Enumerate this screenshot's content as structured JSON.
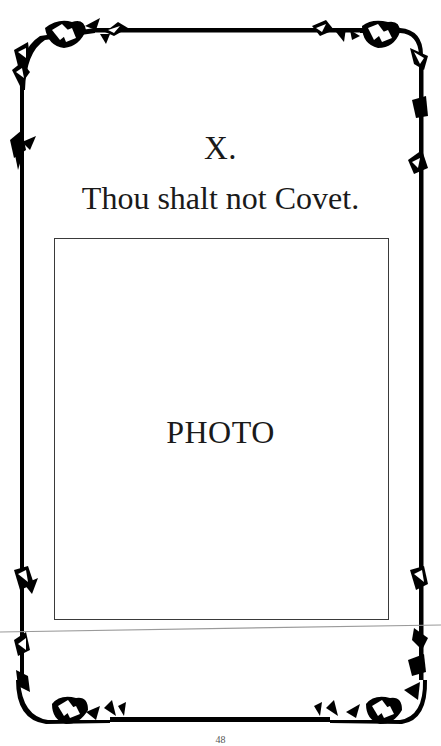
{
  "page": {
    "numeral": "X.",
    "commandment": "Thou shalt not Covet.",
    "photo_placeholder": "PHOTO",
    "page_number": "48"
  },
  "frame": {
    "style": "rose-and-vine corner ornaments",
    "corners": [
      "rose-corner-top-left",
      "rose-corner-top-right",
      "rose-corner-bottom-left",
      "rose-corner-bottom-right"
    ],
    "line_color": "#000000"
  },
  "colors": {
    "background": "#ffffff",
    "text": "#1a1a1a",
    "photo_border": "#3a3a3a",
    "scan_line": "#9a9a9a"
  }
}
